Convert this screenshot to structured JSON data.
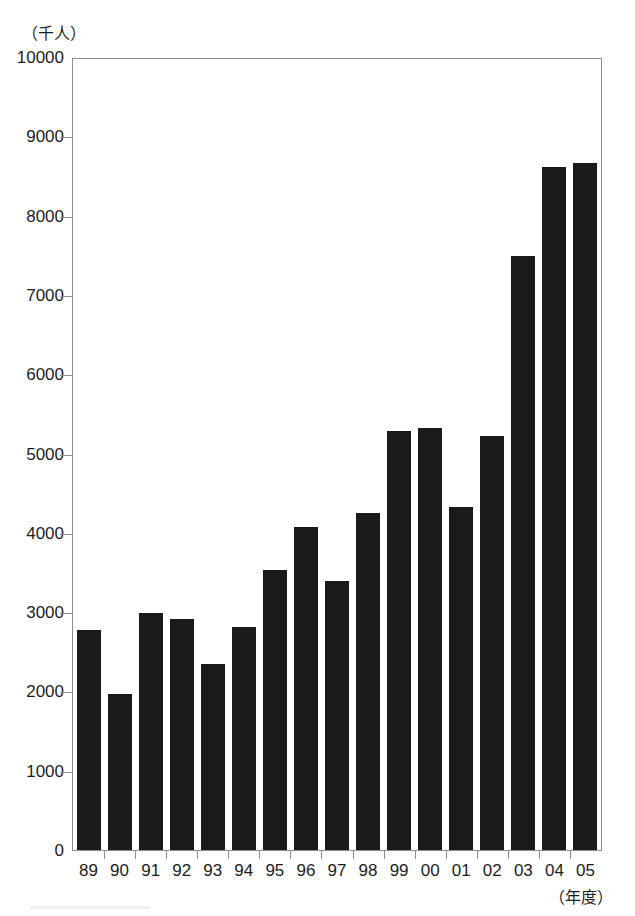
{
  "chart_data": {
    "type": "bar",
    "title": "",
    "xlabel": "（年度）",
    "ylabel": "（千人）",
    "categories": [
      "89",
      "90",
      "91",
      "92",
      "93",
      "94",
      "95",
      "96",
      "97",
      "98",
      "99",
      "00",
      "01",
      "02",
      "03",
      "04",
      "05"
    ],
    "values": [
      2790,
      1980,
      3000,
      2920,
      2360,
      2830,
      3550,
      4080,
      3400,
      4260,
      5300,
      5340,
      4340,
      5230,
      7500,
      8630,
      8680
    ],
    "ylim": [
      0,
      10000
    ],
    "ytick_labels": [
      "10000",
      "9000",
      "8000",
      "7000",
      "6000",
      "5000",
      "4000",
      "3000",
      "2000",
      "1000",
      "0"
    ],
    "ytick_values": [
      10000,
      9000,
      8000,
      7000,
      6000,
      5000,
      4000,
      3000,
      2000,
      1000,
      0
    ],
    "grid": false,
    "legend": "none",
    "bar_color": "#1a1a1a",
    "axis_color": "#8d8d8d",
    "series": [
      {
        "name": "",
        "values": [
          2790,
          1980,
          3000,
          2920,
          2360,
          2830,
          3550,
          4080,
          3400,
          4260,
          5300,
          5340,
          4340,
          5230,
          7500,
          8630,
          8680
        ]
      }
    ]
  }
}
